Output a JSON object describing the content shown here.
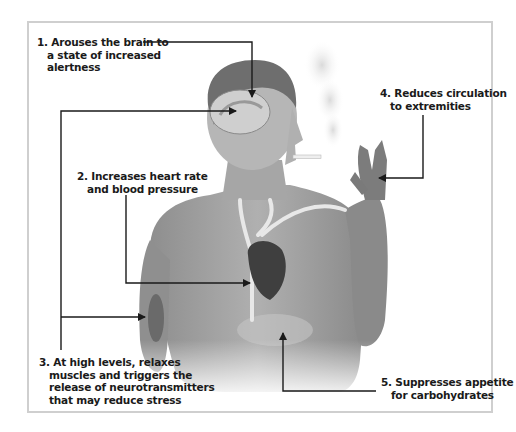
{
  "diagram": {
    "type": "annotated-illustration",
    "colors": {
      "frame_border": "#cfcfcf",
      "background": "#ffffff",
      "text": "#1a1a1a",
      "arrow": "#1a1a1a",
      "skin": "#9a9a9a"
    },
    "annotations": [
      {
        "number": "1.",
        "lines": [
          "Arouses the brain to",
          "a state of increased",
          "alertness"
        ],
        "target": "brain"
      },
      {
        "number": "2.",
        "lines": [
          "Increases heart rate",
          "and blood pressure"
        ],
        "target": "heart"
      },
      {
        "number": "3.",
        "lines": [
          "At high levels, relaxes",
          "muscles and triggers the",
          "release of neurotransmitters",
          "that may reduce stress"
        ],
        "target": "brain and arm muscle"
      },
      {
        "number": "4.",
        "lines": [
          "Reduces circulation",
          "to extremities"
        ],
        "target": "hand"
      },
      {
        "number": "5.",
        "lines": [
          "Suppresses appetite",
          "for carbohydrates"
        ],
        "target": "stomach"
      }
    ]
  },
  "labels": {
    "l1": {
      "a": "1. Arouses the brain to",
      "b": "a state of increased",
      "c": "alertness"
    },
    "l2": {
      "a": "2. Increases heart rate",
      "b": "and blood pressure"
    },
    "l3": {
      "a": "3. At high levels, relaxes",
      "b": "muscles and triggers the",
      "c": "release of neurotransmitters",
      "d": "that may reduce stress"
    },
    "l4": {
      "a": "4. Reduces circulation",
      "b": "to extremities"
    },
    "l5": {
      "a": "5. Suppresses appetite",
      "b": "for carbohydrates"
    }
  }
}
